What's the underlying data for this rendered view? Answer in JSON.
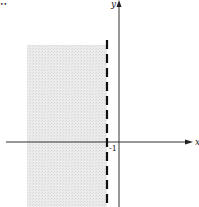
{
  "diagram": {
    "x_axis_label": "x",
    "y_axis_label": "y",
    "boundary_label": "-1",
    "boundary": {
      "type": "vertical-dashed",
      "x": -1
    },
    "shaded_region": "x < -1",
    "colors": {
      "axis": "#333333",
      "boundary": "#111111",
      "shade": "#e2e2e2"
    }
  },
  "corner_mark": "••"
}
